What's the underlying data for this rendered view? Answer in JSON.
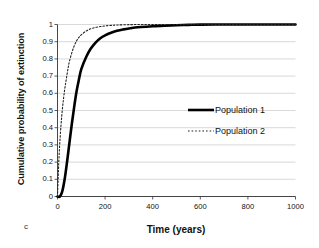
{
  "panel": {
    "label": "c"
  },
  "chart_data": {
    "type": "line",
    "title": "",
    "xlabel": "Time (years)",
    "ylabel": "Cumulative probability of extinction",
    "xlim": [
      0,
      1000
    ],
    "ylim": [
      0,
      1
    ],
    "grid": true,
    "grid_axis": "y",
    "legend_position": "center-right",
    "xticks": [
      0,
      200,
      400,
      600,
      800,
      1000
    ],
    "xtick_labels": [
      "0",
      "200",
      "400",
      "600",
      "800",
      "1000"
    ],
    "yticks": [
      0,
      0.1,
      0.2,
      0.3,
      0.4,
      0.5,
      0.6,
      0.7,
      0.8,
      0.9,
      1
    ],
    "ytick_labels": [
      "0",
      "0.1",
      "0.2",
      "0.3",
      "0.4",
      "0.5",
      "0.6",
      "0.7",
      "0.8",
      "0.9",
      "1"
    ],
    "series": [
      {
        "name": "Population 1",
        "style": "solid",
        "color": "#000000",
        "width": 2.6,
        "x": [
          0,
          10,
          20,
          30,
          40,
          50,
          60,
          70,
          80,
          90,
          100,
          120,
          140,
          160,
          180,
          200,
          225,
          250,
          275,
          300,
          350,
          400,
          450,
          500,
          550,
          600,
          700,
          800,
          900,
          1000
        ],
        "y": [
          0.0,
          0.0,
          0.03,
          0.1,
          0.2,
          0.31,
          0.42,
          0.52,
          0.61,
          0.68,
          0.74,
          0.81,
          0.86,
          0.895,
          0.92,
          0.937,
          0.952,
          0.963,
          0.971,
          0.977,
          0.985,
          0.99,
          0.993,
          0.996,
          0.998,
          0.999,
          1.0,
          1.0,
          1.0,
          1.0
        ]
      },
      {
        "name": "Population 2",
        "style": "dotted",
        "color": "#222222",
        "width": 1.1,
        "x": [
          0,
          3,
          6,
          10,
          15,
          20,
          25,
          30,
          35,
          40,
          45,
          50,
          60,
          70,
          80,
          90,
          100,
          120,
          140,
          160,
          180,
          200,
          225,
          250,
          300,
          350,
          400,
          500,
          600,
          700,
          800,
          900,
          1000
        ],
        "y": [
          0.0,
          0.12,
          0.22,
          0.32,
          0.42,
          0.5,
          0.565,
          0.62,
          0.665,
          0.71,
          0.75,
          0.785,
          0.835,
          0.875,
          0.905,
          0.925,
          0.94,
          0.962,
          0.975,
          0.983,
          0.988,
          0.992,
          0.995,
          0.997,
          0.999,
          1.0,
          1.0,
          1.0,
          1.0,
          1.0,
          1.0,
          1.0,
          1.0
        ]
      }
    ]
  },
  "legend": {
    "entries": [
      {
        "label": "Population 1",
        "style": "solid"
      },
      {
        "label": "Population 2",
        "style": "dotted"
      }
    ]
  }
}
